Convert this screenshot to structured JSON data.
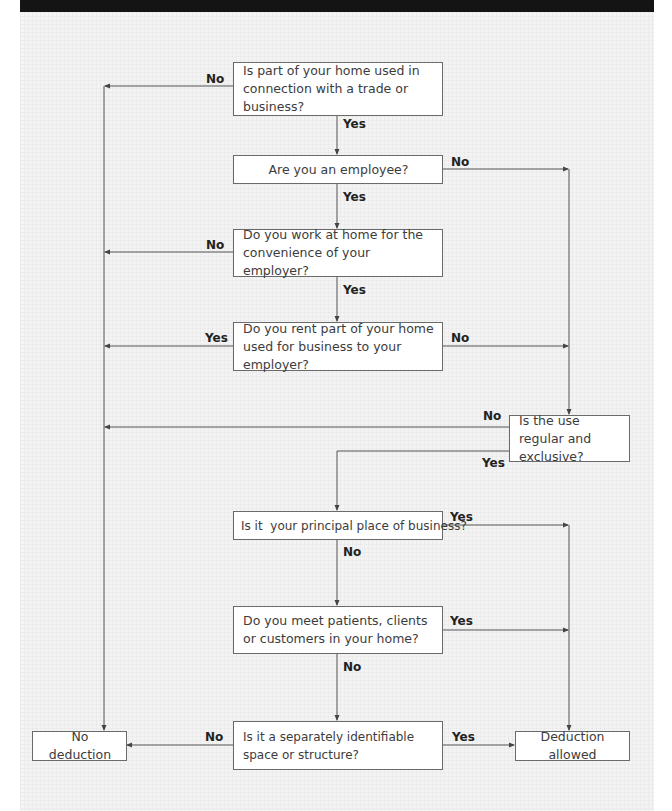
{
  "header": {
    "bar_color": "#141414"
  },
  "flowchart": {
    "nodes": {
      "q1": "Is part of your home used in connection with a trade or business?",
      "q2": "Are you an employee?",
      "q3": "Do you work at home for the convenience of your employer?",
      "q4": "Do you rent part of your home used for business to your employer?",
      "q5": "Is the use regular and exclusive?",
      "q6": "Is it  your principal place of business?",
      "q7": "Do you meet patients, clients or customers in your home?",
      "q8": "Is it a separately identifiable space or structure?",
      "no_deduction": "No deduction",
      "deduction_allowed": "Deduction allowed"
    },
    "labels": {
      "q1_no": "No",
      "q1_yes": "Yes",
      "q2_no": "No",
      "q2_yes": "Yes",
      "q3_no": "No",
      "q3_yes": "Yes",
      "q4_yes": "Yes",
      "q4_no": "No",
      "q5_no": "No",
      "q5_yes": "Yes",
      "q6_yes": "Yes",
      "q6_no": "No",
      "q7_yes": "Yes",
      "q7_no": "No",
      "q8_no": "No",
      "q8_yes": "Yes"
    },
    "edges": [
      {
        "from": "q1",
        "to": "no_deduction",
        "label": "No"
      },
      {
        "from": "q1",
        "to": "q2",
        "label": "Yes"
      },
      {
        "from": "q2",
        "to": "q5",
        "label": "No"
      },
      {
        "from": "q2",
        "to": "q3",
        "label": "Yes"
      },
      {
        "from": "q3",
        "to": "no_deduction",
        "label": "No"
      },
      {
        "from": "q3",
        "to": "q4",
        "label": "Yes"
      },
      {
        "from": "q4",
        "to": "no_deduction",
        "label": "Yes"
      },
      {
        "from": "q4",
        "to": "q5",
        "label": "No"
      },
      {
        "from": "q5",
        "to": "no_deduction",
        "label": "No"
      },
      {
        "from": "q5",
        "to": "q6",
        "label": "Yes"
      },
      {
        "from": "q6",
        "to": "deduction_allowed",
        "label": "Yes"
      },
      {
        "from": "q6",
        "to": "q7",
        "label": "No"
      },
      {
        "from": "q7",
        "to": "deduction_allowed",
        "label": "Yes"
      },
      {
        "from": "q7",
        "to": "q8",
        "label": "No"
      },
      {
        "from": "q8",
        "to": "no_deduction",
        "label": "No"
      },
      {
        "from": "q8",
        "to": "deduction_allowed",
        "label": "Yes"
      }
    ]
  }
}
